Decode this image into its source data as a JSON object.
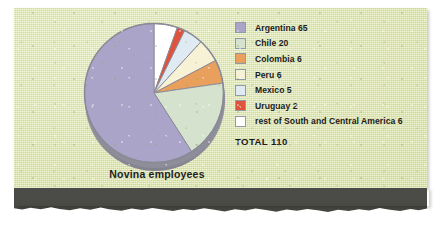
{
  "chart_data": {
    "type": "pie",
    "title": "Novina employees",
    "total_label": "TOTAL 110",
    "total": 110,
    "unit": "employees",
    "legend_position": "right",
    "grid": false,
    "categories": [
      "Argentina",
      "Chile",
      "Colombia",
      "Peru",
      "Mexico",
      "Uruguay",
      "rest of South and Central America"
    ],
    "values": [
      65,
      20,
      6,
      6,
      5,
      2,
      6
    ],
    "colors": [
      "#aaa4c8",
      "#d5e2cd",
      "#e8a05c",
      "#f7f2d5",
      "#dfeaf3",
      "#e0523a",
      "#ffffff"
    ],
    "legend_entries": [
      {
        "label": "Argentina 65",
        "name": "Argentina",
        "value": 65,
        "color": "#aaa4c8"
      },
      {
        "label": "Chile 20",
        "name": "Chile",
        "value": 20,
        "color": "#d5e2cd"
      },
      {
        "label": "Colombia 6",
        "name": "Colombia",
        "value": 6,
        "color": "#e8a05c"
      },
      {
        "label": "Peru 6",
        "name": "Peru",
        "value": 6,
        "color": "#f7f2d5"
      },
      {
        "label": "Mexico 5",
        "name": "Mexico",
        "value": 5,
        "color": "#dfeaf3"
      },
      {
        "label": "Uruguay 2",
        "name": "Uruguay",
        "value": 2,
        "color": "#e0523a"
      },
      {
        "label": "rest of South and Central America 6",
        "name": "rest of South and Central America",
        "value": 6,
        "color": "#ffffff"
      }
    ],
    "slice_order_clockwise_from_top": [
      "rest of South and Central America",
      "Uruguay",
      "Mexico",
      "Peru",
      "Colombia",
      "Chile",
      "Argentina"
    ]
  },
  "theme": {
    "paper_color": "#e3ebb4",
    "band_color": "#4b4b47",
    "text_color": "#1b1b1b",
    "pie_rim_color": "#9a9aa6"
  }
}
